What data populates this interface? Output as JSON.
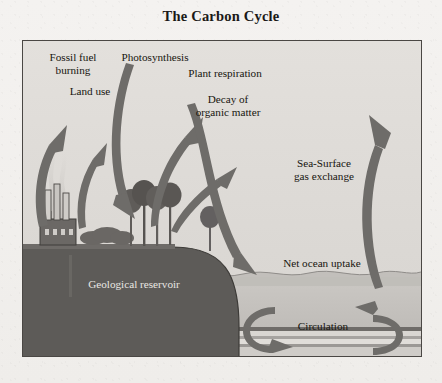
{
  "title": "The Carbon Cycle",
  "figure": {
    "border_color": "#4a4744",
    "sky_color": "#dedbd7",
    "land_color": "#5d5b58",
    "ocean_color": "#c9c6c2",
    "arrow_color": "#6e6c69"
  },
  "labels": {
    "fossil_fuel": "Fossil fuel\nburning",
    "photosynthesis": "Photosynthesis",
    "land_use": "Land use",
    "plant_respiration": "Plant respiration",
    "decay": "Decay of\norganic matter",
    "sea_surface": "Sea-Surface\ngas exchange",
    "net_ocean_uptake": "Net ocean uptake",
    "circulation": "Circulation",
    "geological_reservoir": "Geological reservoir"
  },
  "diagram_data": {
    "type": "diagram",
    "subject": "carbon cycle",
    "compartments": [
      {
        "name": "atmosphere",
        "region": "sky"
      },
      {
        "name": "land biosphere",
        "region": "left hill with trees"
      },
      {
        "name": "geological reservoir",
        "region": "dark landmass below surface"
      },
      {
        "name": "ocean",
        "region": "right water body with sediment layers"
      }
    ],
    "flows": [
      {
        "label": "Fossil fuel burning",
        "from": "geological reservoir",
        "to": "atmosphere",
        "direction": "up"
      },
      {
        "label": "Land use",
        "from": "land biosphere",
        "to": "atmosphere",
        "direction": "up"
      },
      {
        "label": "Photosynthesis",
        "from": "atmosphere",
        "to": "land biosphere",
        "direction": "down"
      },
      {
        "label": "Plant respiration",
        "from": "land biosphere",
        "to": "atmosphere",
        "direction": "up"
      },
      {
        "label": "Decay of organic matter",
        "from": "land biosphere",
        "to": "atmosphere",
        "direction": "up"
      },
      {
        "label": "Net ocean uptake",
        "from": "atmosphere",
        "to": "ocean",
        "direction": "down"
      },
      {
        "label": "Sea-Surface gas exchange",
        "from": "ocean",
        "to": "atmosphere",
        "direction": "up"
      },
      {
        "label": "Circulation",
        "from": "ocean surface",
        "to": "ocean interior",
        "direction": "loop"
      }
    ],
    "scene_objects": [
      "factory with three smokestacks and smoke plumes",
      "shrubs",
      "four trees on hill crest",
      "wavy ocean surface",
      "layered ocean-floor sediments"
    ]
  }
}
